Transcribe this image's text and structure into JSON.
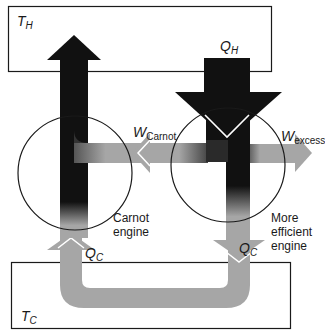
{
  "diagram": {
    "reservoirs": {
      "hot": {
        "symbol": "T",
        "subscript": "H"
      },
      "cold": {
        "symbol": "T",
        "subscript": "C"
      }
    },
    "flows": {
      "q_hot": {
        "symbol": "Q",
        "subscript": "H"
      },
      "w_carnot": {
        "symbol": "W",
        "subscript": "Carnot"
      },
      "w_excess": {
        "symbol": "W",
        "subscript": "excess"
      },
      "q_cold_left": {
        "symbol": "Q",
        "subscript": "C"
      },
      "q_cold_right": {
        "symbol": "Q",
        "subscript": "C"
      }
    },
    "engines": {
      "carnot": {
        "line1": "Carnot",
        "line2": "engine"
      },
      "efficient": {
        "line1": "More",
        "line2": "efficient",
        "line3": "engine"
      }
    },
    "colors": {
      "heat_dark": "#111111",
      "flow_gray": "#a6a6a6",
      "outline": "#1a1a1a",
      "background": "#ffffff"
    }
  }
}
